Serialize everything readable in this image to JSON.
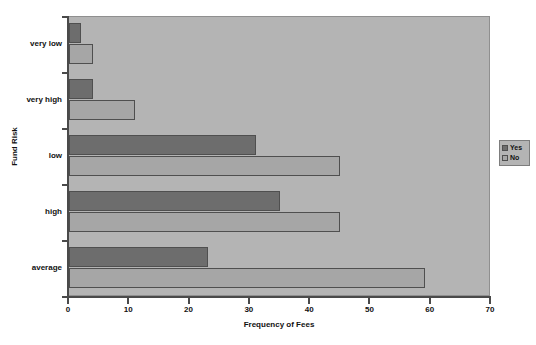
{
  "chart_data": {
    "type": "bar",
    "orientation": "horizontal",
    "title": "Fund Risk and Fees",
    "xlabel": "Frequency of Fees",
    "ylabel": "Fund Risk",
    "categories": [
      "very low",
      "very high",
      "low",
      "high",
      "average"
    ],
    "series": [
      {
        "name": "Yes",
        "color": "#6d6d6d",
        "values": [
          2,
          4,
          31,
          35,
          23
        ]
      },
      {
        "name": "No",
        "color": "#a6a6a6",
        "values": [
          4,
          11,
          45,
          45,
          59
        ]
      }
    ],
    "xlim": [
      0,
      70
    ],
    "xticks": [
      0,
      10,
      20,
      30,
      40,
      50,
      60,
      70
    ],
    "xtick_labels": [
      "0",
      "10",
      "20",
      "30",
      "40",
      "50",
      "60",
      "70"
    ],
    "grid": false,
    "legend_position": "right",
    "plot_background": "#b4b4b4",
    "figure_background": "#ffffff"
  },
  "legend": {
    "entries": [
      {
        "label": "Yes",
        "color": "#6d6d6d"
      },
      {
        "label": "No",
        "color": "#a6a6a6"
      }
    ]
  }
}
